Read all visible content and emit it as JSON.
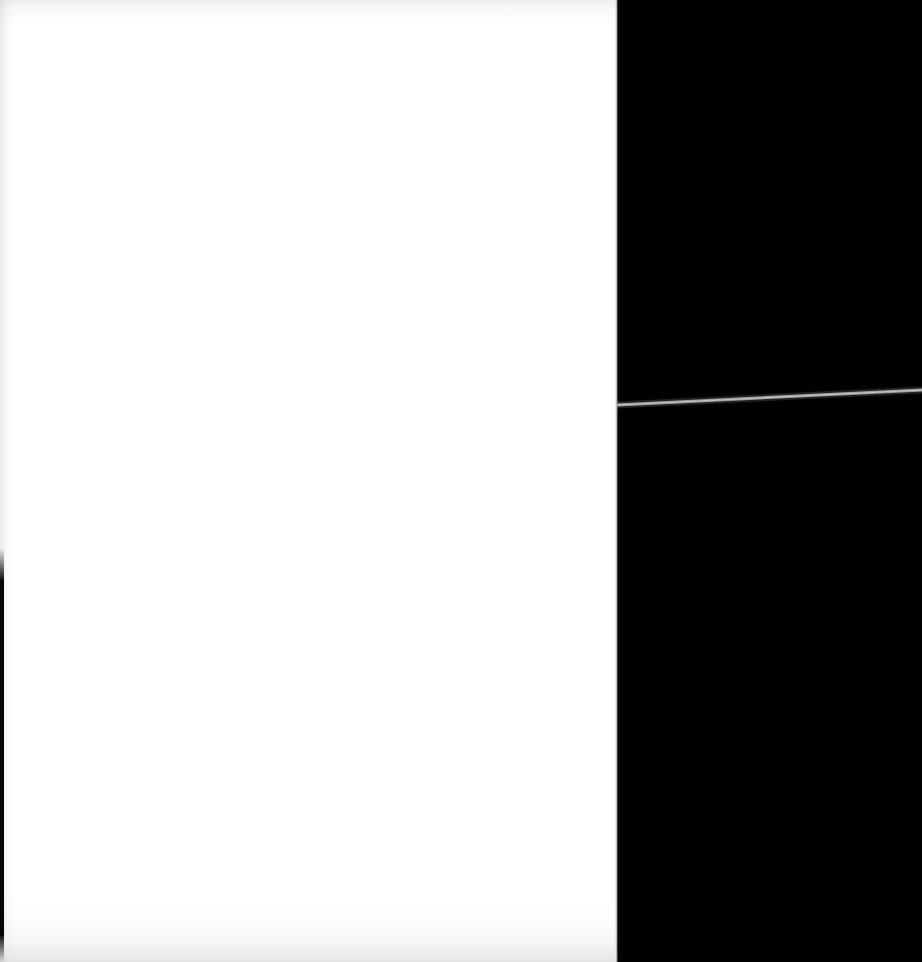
{
  "document": {
    "title": "Blank scanned page",
    "caption": "Blank white page with black scanner background and a thin gray diagonal streak",
    "width_px": 922,
    "height_px": 962
  },
  "page": {
    "name": "scanned-page",
    "content_text": "",
    "background_color": "#ffffff",
    "left_px": 0,
    "top_px": 0,
    "width_px": 618,
    "height_px": 962
  },
  "background": {
    "name": "scanner-backing",
    "color": "#000000",
    "left_px": 618,
    "top_px": 0,
    "width_px": 304,
    "height_px": 962
  },
  "artifacts": {
    "diagonal_streak": {
      "name": "gray-diagonal-streak",
      "color": "#9a9a9a",
      "thickness_px": 3,
      "x1_px": 617,
      "y1_px": 405,
      "x2_px": 922,
      "y2_px": 390
    },
    "binding_strip": {
      "name": "left-edge-black-strip",
      "color": "#050505",
      "left_px": 0,
      "top_px": 580,
      "width_px": 4,
      "height_px": 356
    },
    "edge_shading": {
      "top_label": "top edge gray wash",
      "bottom_label": "bottom edge gray wash",
      "left_label": "left margin gray wash",
      "color": "#8f8f96"
    }
  }
}
